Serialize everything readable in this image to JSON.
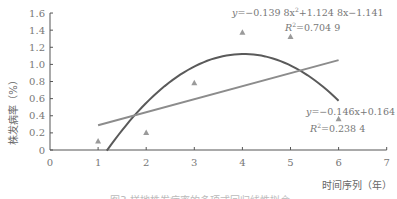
{
  "chart_data": {
    "type": "scatter",
    "title": "",
    "xlabel": "时间序列（年）",
    "ylabel": "株发病率（%）",
    "xlim": [
      0,
      7
    ],
    "ylim": [
      0,
      1.6
    ],
    "x_ticks": [
      "0",
      "1",
      "2",
      "3",
      "4",
      "5",
      "6",
      "7"
    ],
    "y_ticks": [
      "0",
      "0.2",
      "0.4",
      "0.6",
      "0.8",
      "1.0",
      "1.2",
      "1.4",
      "1.6"
    ],
    "grid": false,
    "series": [
      {
        "name": "observed",
        "marker": "triangle",
        "x": [
          1,
          2,
          3,
          4,
          5,
          6
        ],
        "y": [
          0.1,
          0.2,
          0.78,
          1.37,
          1.32,
          0.36
        ]
      },
      {
        "name": "polynomial fit",
        "type": "curve",
        "equation": "y=-0.139 8x²+1.124 8x-1.141",
        "r2": "R²=0.704 9",
        "coefficients": {
          "a": -0.1398,
          "b": 1.1248,
          "c": -1.141
        },
        "x_range": [
          1.18,
          6
        ]
      },
      {
        "name": "linear fit",
        "type": "line",
        "equation": "y=-0.146x+0.164",
        "r2": "R²=0.238 4",
        "x_range": [
          1,
          6
        ],
        "endpoints": [
          [
            1,
            0.29
          ],
          [
            6,
            1.05
          ]
        ]
      }
    ],
    "colors": {
      "curve": "#5a5a5a",
      "line": "#8c8c8c",
      "marker": "#9a9a9a",
      "axis": "#555555"
    }
  },
  "labels": {
    "poly_eq_prefix": "y",
    "poly_eq": "=−0.139 8x",
    "poly_eq_sup": "2",
    "poly_eq_rest": "+1.124 8x−1.141",
    "poly_r2_R": "R",
    "poly_r2_sup": "2",
    "poly_r2_val": "=0.704 9",
    "lin_eq_prefix": "y",
    "lin_eq": "=−0.146x+0.164",
    "lin_r2_R": "R",
    "lin_r2_sup": "2",
    "lin_r2_val": "=0.238 4",
    "xlabel": "时间序列（年）",
    "ylabel": "株发病率（%）",
    "caption": "图3  样地株发病率的多项式回归线性拟合"
  }
}
